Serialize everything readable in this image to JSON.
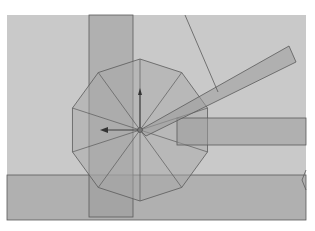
{
  "viewport": {
    "background": "#ffffff",
    "area": {
      "x": 7,
      "y": 15,
      "w": 299,
      "h": 205,
      "fill": "#c9c9c9"
    },
    "colors": {
      "plane_fill": "#9a9a9a",
      "plane_opacity": 0.55,
      "edge": "#5a5a5a",
      "mesh_fill": "#a8a8a8",
      "mesh_opacity": 0.5,
      "arrow": "#333333"
    }
  },
  "objects": {
    "vertical_plane": {
      "x": 89,
      "y": 15,
      "w": 44,
      "h": 202
    },
    "horizontal_plane": {
      "x": 7,
      "y": 175,
      "w": 299,
      "h": 45
    },
    "right_bar": {
      "x": 177,
      "y": 118,
      "w": 129,
      "h": 27
    },
    "diagonal_bar": {
      "points": "140,130 289,46 296,62 146,136"
    },
    "decagon": {
      "cx": 140,
      "cy": 130,
      "r": 71,
      "sides": 10
    },
    "pointer_line": {
      "x1": 185,
      "y1": 15,
      "x2": 218,
      "y2": 92
    },
    "edge_mark": {
      "points": "306,170 302,180 306,190"
    }
  },
  "gizmo": {
    "center": {
      "x": 140,
      "y": 130
    },
    "up_arrow_tip": {
      "x": 140,
      "y": 88
    },
    "left_arrow_tip": {
      "x": 100,
      "y": 130
    }
  }
}
